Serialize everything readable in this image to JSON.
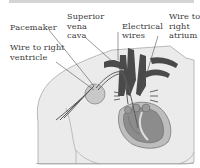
{
  "figure": {
    "labels": {
      "pacemaker": "Pacemaker",
      "superior_vena_cava_1": "Superior",
      "superior_vena_cava_2": "vena",
      "superior_vena_cava_3": "cava",
      "electrical_wires_1": "Electrical",
      "electrical_wires_2": "wires",
      "wire_right_atrium_1": "Wire to",
      "wire_right_atrium_2": "right",
      "wire_right_atrium_3": "atrium",
      "wire_right_ventricle_1": "Wire to right",
      "wire_right_ventricle_2": "ventricle"
    },
    "colors": {
      "background": "#ffffff",
      "torso_fill": "#ebebeb",
      "torso_outline": "#a8a8a8",
      "vessel_dark": "#4a4a4a",
      "heart_mid": "#8c8c8c",
      "heart_light": "#bdbdbd",
      "pacemaker_fill": "#c8c8c8",
      "leader_line": "#555555",
      "top_bar": "#d4d4d4"
    }
  }
}
